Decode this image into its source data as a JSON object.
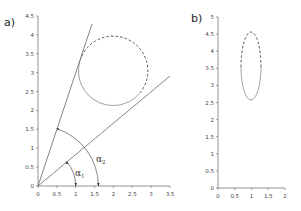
{
  "panels": [
    {
      "label": "a)",
      "x_ticks": [
        "0",
        "0.5",
        "1",
        "1.5",
        "2",
        "2.5",
        "3",
        "3.5"
      ],
      "y_ticks": [
        "0",
        "0.5",
        "1",
        "1.5",
        "2",
        "2.5",
        "3",
        "3.5",
        "4",
        "4.5"
      ],
      "xlim": [
        0,
        3.5
      ],
      "ylim": [
        0,
        4.5
      ],
      "shapes": {
        "circle": {
          "center": [
            2.0,
            3.05
          ],
          "radius": 0.92,
          "solid_part": "lower-left",
          "dashed_part": "upper-right"
        },
        "tangent_line_1": {
          "from": [
            0,
            0
          ],
          "to": [
            1.43,
            4.3
          ]
        },
        "tangent_line_2": {
          "from": [
            0,
            0
          ],
          "to": [
            3.5,
            2.93
          ]
        },
        "arc_alpha_1": {
          "radius": 1.0
        },
        "arc_alpha_2": {
          "radius": 1.6
        }
      },
      "angle_labels": [
        {
          "symbol": "α",
          "subscript": "1"
        },
        {
          "symbol": "α",
          "subscript": "2"
        }
      ]
    },
    {
      "label": "b)",
      "x_ticks": [
        "0",
        "0.5",
        "1",
        "1.5",
        "2"
      ],
      "y_ticks": [
        "0",
        "0.5",
        "1",
        "1.5",
        "2",
        "2.5",
        "3",
        "3.5",
        "4",
        "4.5",
        "5"
      ],
      "xlim": [
        0,
        2
      ],
      "ylim": [
        0,
        5
      ],
      "shapes": {
        "ellipse": {
          "center": [
            0.98,
            3.6
          ],
          "rx": 0.3,
          "ry": 1.0,
          "solid_part": "lower",
          "dashed_part": "upper"
        }
      }
    }
  ]
}
